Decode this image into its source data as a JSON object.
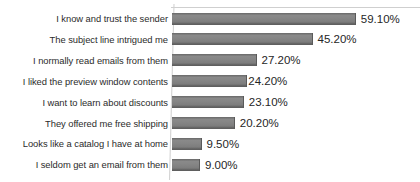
{
  "chart_data": {
    "type": "bar",
    "orientation": "horizontal",
    "title": "",
    "subtitle": "",
    "xlabel": "",
    "ylabel": "",
    "grid": false,
    "legend": false,
    "legend_position": "none",
    "value_suffix": "%",
    "xlim": [
      0,
      60
    ],
    "axis": {
      "show_category_axis": true,
      "show_value_axis": false,
      "show_top_border": true
    },
    "colors": {
      "bar": "#7f7f7f",
      "bar_edge": "#5f5f5f",
      "category_label": "#2b2b2b",
      "value_label": "#262626",
      "axis_line": "#d0d0d0",
      "background": "#ffffff"
    },
    "categories": [
      "I know and trust the sender",
      "The subject line intrigued me",
      "I normally read emails from them",
      "I liked the preview window contents",
      "I want to learn about discounts",
      "They offered me free shipping",
      "Looks like a catalog I have at home",
      "I seldom get an email from them"
    ],
    "values": [
      59.1,
      45.2,
      27.2,
      24.2,
      23.1,
      20.2,
      9.5,
      9.0
    ],
    "value_labels": [
      "59.10%",
      "45.20%",
      "27.20%",
      "24.20%",
      "23.10%",
      "20.20%",
      "9.50%",
      "9.00%"
    ]
  }
}
